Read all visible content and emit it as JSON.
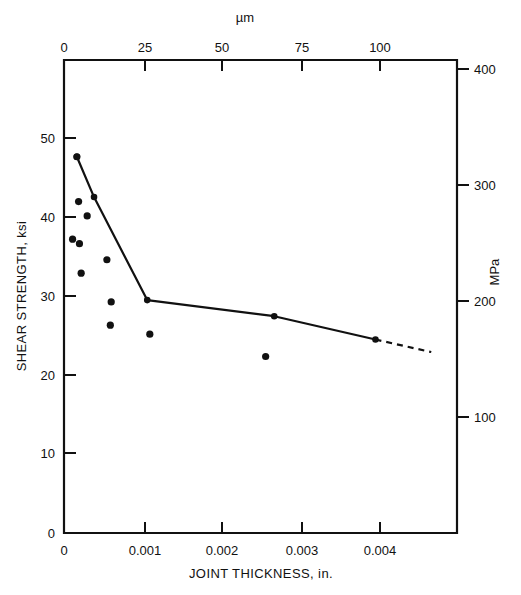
{
  "chart_data": {
    "type": "scatter",
    "title": "",
    "xlabel": "JOINT THICKNESS, in.",
    "ylabel": "SHEAR STRENGTH, ksi",
    "x2label": "µm",
    "y2label": "MPa",
    "xlim": [
      0,
      0.00458
    ],
    "ylim": [
      0,
      52.8
    ],
    "x2lim": [
      0,
      116.3
    ],
    "y2lim": [
      0,
      364
    ],
    "grid": false,
    "legend": null,
    "xticks": [
      0,
      0.001,
      0.002,
      0.003,
      0.004
    ],
    "xticklabels": [
      "0",
      "0.001",
      "0.002",
      "0.003",
      "0.004"
    ],
    "yticks": [
      0,
      10,
      20,
      30,
      40,
      50
    ],
    "yticklabels": [
      "0",
      "10",
      "20",
      "30",
      "40",
      "50"
    ],
    "x2ticks": [
      0,
      25,
      50,
      75,
      100
    ],
    "x2ticklabels": [
      "0",
      "25",
      "50",
      "75",
      "100"
    ],
    "y2ticks": [
      100,
      200,
      300,
      400
    ],
    "y2ticklabels": [
      "100",
      "200",
      "300",
      "400"
    ],
    "series": [
      {
        "name": "measured-data",
        "type": "scatter",
        "marker": "filled-circle",
        "color": "#111111",
        "points": [
          {
            "x": 0.00015,
            "y": 42.0
          },
          {
            "x": 0.00017,
            "y": 37.0
          },
          {
            "x": 0.00027,
            "y": 35.4
          },
          {
            "x": 0.0001,
            "y": 32.8
          },
          {
            "x": 0.00018,
            "y": 32.3
          },
          {
            "x": 0.0005,
            "y": 30.5
          },
          {
            "x": 0.0002,
            "y": 29.0
          },
          {
            "x": 0.00055,
            "y": 25.8
          },
          {
            "x": 0.00054,
            "y": 23.2
          },
          {
            "x": 0.001,
            "y": 22.2
          },
          {
            "x": 0.00235,
            "y": 19.7
          }
        ]
      },
      {
        "name": "trend-line-solid",
        "type": "line",
        "style": "solid",
        "color": "#111111",
        "points": [
          {
            "x": 0.00015,
            "y": 42.0
          },
          {
            "x": 0.00035,
            "y": 37.5
          },
          {
            "x": 0.00097,
            "y": 26.0
          },
          {
            "x": 0.00245,
            "y": 24.2
          },
          {
            "x": 0.00363,
            "y": 21.6
          }
        ],
        "node_markers": [
          {
            "x": 0.00015,
            "y": 42.0
          },
          {
            "x": 0.00035,
            "y": 37.5
          },
          {
            "x": 0.00097,
            "y": 26.0
          },
          {
            "x": 0.00245,
            "y": 24.2
          },
          {
            "x": 0.00363,
            "y": 21.6
          }
        ]
      },
      {
        "name": "trend-line-extrapolated",
        "type": "line",
        "style": "dashed",
        "color": "#111111",
        "points": [
          {
            "x": 0.00363,
            "y": 21.6
          },
          {
            "x": 0.00428,
            "y": 20.2
          }
        ]
      }
    ]
  },
  "axes": {
    "bottom": {
      "title": "JOINT THICKNESS, in.",
      "labels": [
        "0",
        "0.001",
        "0.002",
        "0.003",
        "0.004"
      ]
    },
    "left": {
      "title": "SHEAR STRENGTH, ksi",
      "labels": [
        "50",
        "40",
        "30",
        "20",
        "10",
        "0"
      ]
    },
    "top": {
      "title": "µm",
      "labels": [
        "0",
        "25",
        "50",
        "75",
        "100"
      ]
    },
    "right": {
      "title": "MPa",
      "labels": [
        "400",
        "300",
        "200",
        "100"
      ]
    }
  }
}
